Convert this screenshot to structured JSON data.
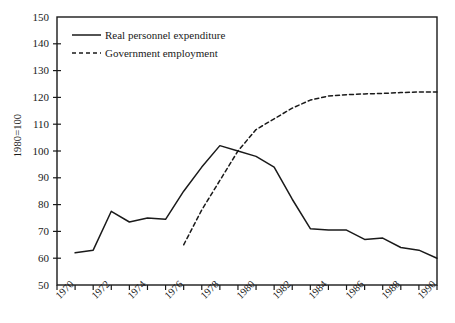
{
  "chart_data": {
    "type": "line",
    "title": "",
    "subtitle": "",
    "xlabel": "",
    "ylabel": "1980=100",
    "xlim": [
      1970,
      1991
    ],
    "ylim": [
      50,
      150
    ],
    "grid": false,
    "legend_position": "top-left",
    "y_ticks": [
      50,
      60,
      70,
      80,
      90,
      100,
      110,
      120,
      130,
      140,
      150
    ],
    "y_tick_labels": [
      "50",
      "60",
      "70",
      "80",
      "90",
      "100",
      "110",
      "120",
      "130",
      "140",
      "150"
    ],
    "x_ticks": [
      1970,
      1971,
      1972,
      1973,
      1974,
      1975,
      1976,
      1977,
      1978,
      1979,
      1980,
      1981,
      1982,
      1983,
      1984,
      1985,
      1986,
      1987,
      1988,
      1989,
      1990,
      1991
    ],
    "x_tick_labels": [
      "1970",
      "1972",
      "1974",
      "1976",
      "1978",
      "1980",
      "1982",
      "1984",
      "1986",
      "1988",
      "1990"
    ],
    "x_tick_labels_years": [
      1970,
      1972,
      1974,
      1976,
      1978,
      1980,
      1982,
      1984,
      1986,
      1988,
      1990
    ],
    "series": [
      {
        "name": "Real personnel expenditure",
        "style": "solid",
        "color": "#1a1a1a",
        "x": [
          1971,
          1972,
          1973,
          1974,
          1975,
          1976,
          1977,
          1978,
          1979,
          1980,
          1981,
          1982,
          1983,
          1984,
          1985,
          1986,
          1987,
          1988,
          1989,
          1990,
          1991
        ],
        "values": [
          62,
          63,
          77.5,
          73.5,
          75,
          74.5,
          85,
          94,
          102,
          100,
          98,
          94,
          82,
          71,
          70.5,
          70.5,
          67,
          67.5,
          64,
          63,
          60
        ]
      },
      {
        "name": "Government employment",
        "style": "dashed",
        "color": "#1a1a1a",
        "x": [
          1977,
          1978,
          1979,
          1980,
          1981,
          1982,
          1983,
          1984,
          1985,
          1986,
          1987,
          1988,
          1989,
          1990,
          1991
        ],
        "values": [
          65,
          78,
          89,
          100,
          108,
          112,
          116,
          119,
          120.5,
          121,
          121.3,
          121.5,
          121.8,
          122,
          122
        ]
      }
    ]
  },
  "legend": {
    "items": [
      {
        "label": "Real personnel expenditure",
        "style": "solid"
      },
      {
        "label": "Government employment",
        "style": "dashed"
      }
    ]
  },
  "axis": {
    "y_title": "1980=100"
  }
}
